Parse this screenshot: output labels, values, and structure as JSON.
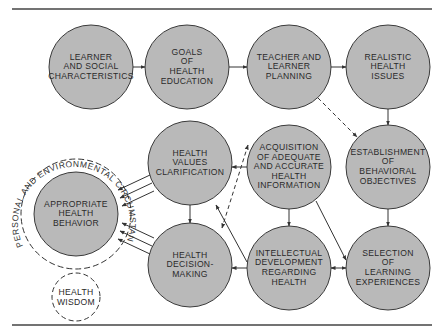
{
  "colors": {
    "node_fill": "#b9b9b9",
    "stroke": "#3a3a3a",
    "rule": "#444444"
  },
  "nodes": [
    {
      "id": "learner",
      "label": "LEARNER\nAND SOCIAL\nCHARACTERISTICS",
      "cx": 91,
      "cy": 67,
      "r": 42
    },
    {
      "id": "goals",
      "label": "GOALS\nOF\nHEALTH\nEDUCATION",
      "cx": 187,
      "cy": 67,
      "r": 42
    },
    {
      "id": "planning",
      "label": "TEACHER AND\nLEARNER\nPLANNING",
      "cx": 289,
      "cy": 67,
      "r": 42
    },
    {
      "id": "issues",
      "label": "REALISTIC\nHEALTH\nISSUES",
      "cx": 388,
      "cy": 67,
      "r": 42
    },
    {
      "id": "objectives",
      "label": "ESTABLISHMENT\nOF\nBEHAVIORAL\nOBJECTIVES",
      "cx": 388,
      "cy": 167,
      "r": 42
    },
    {
      "id": "selection",
      "label": "SELECTION\nOF\nLEARNING\nEXPERIENCES",
      "cx": 388,
      "cy": 268,
      "r": 42
    },
    {
      "id": "intellectual",
      "label": "INTELLECTUAL\nDEVELOPMENT\nREGARDING\nHEALTH",
      "cx": 289,
      "cy": 268,
      "r": 42
    },
    {
      "id": "acquisition",
      "label": "ACQUISITION\nOF ADEQUATE\nAND ACCURATE\nHEALTH\nINFORMATION",
      "cx": 289,
      "cy": 167,
      "r": 42
    },
    {
      "id": "values",
      "label": "HEALTH\nVALUES\nCLARIFICATION",
      "cx": 190,
      "cy": 163,
      "r": 42
    },
    {
      "id": "decision",
      "label": "HEALTH\nDECISION-\nMAKING",
      "cx": 190,
      "cy": 265,
      "r": 42
    },
    {
      "id": "behavior",
      "label": "APPROPRIATE\nHEALTH\nBEHAVIOR",
      "cx": 76,
      "cy": 214,
      "r": 42
    }
  ],
  "outer_ring": {
    "label": "PERSONAL AND ENVIRONMENTAL CIRCUMSTANCES",
    "cx": 76,
    "cy": 214,
    "r": 55
  },
  "wisdom": {
    "label": "HEALTH\nWISDOM",
    "cx": 76,
    "cy": 297,
    "r": 24
  }
}
